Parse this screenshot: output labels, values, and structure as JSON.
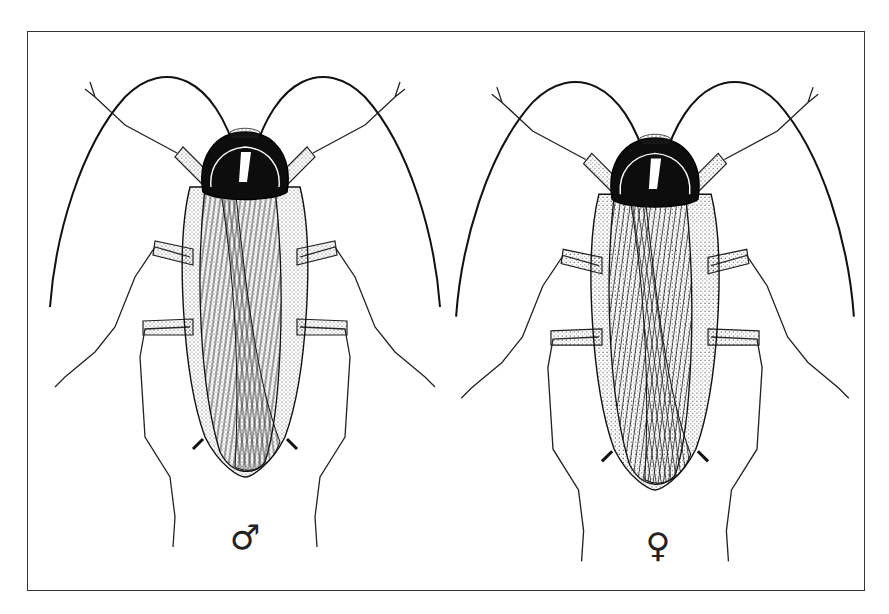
{
  "figure": {
    "specimens": [
      {
        "id": "male",
        "symbol": "♂",
        "label": "male",
        "center_x": 245,
        "symbol_pos": [
          245,
          537
        ]
      },
      {
        "id": "female",
        "symbol": "♀",
        "label": "female",
        "center_x": 655,
        "symbol_pos": [
          658,
          545
        ]
      }
    ],
    "colors": {
      "line": "#1a1a1a",
      "pronotum": "#0d0d0d",
      "background": "#ffffff",
      "frame": "#333333"
    }
  }
}
